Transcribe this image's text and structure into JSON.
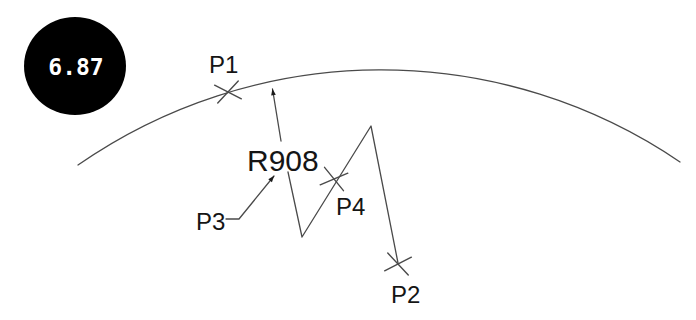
{
  "badge": {
    "value": "6.87"
  },
  "radius_dimension": {
    "label": "R908"
  },
  "point_labels": {
    "p1": "P1",
    "p2": "P2",
    "p3": "P3",
    "p4": "P4"
  },
  "colors": {
    "line": "#4a4a4a",
    "text": "#151515",
    "badge_background": "#000000",
    "badge_text": "#ffffff"
  }
}
